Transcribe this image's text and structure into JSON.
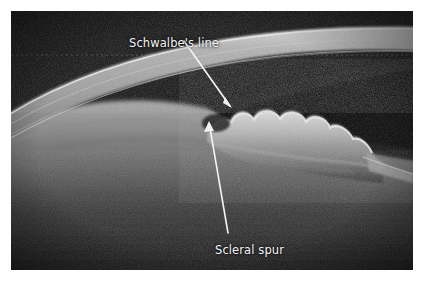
{
  "figure": {
    "kind": "anterior-segment-oct-image",
    "modality_caption": "Anterior segment OCT of the iridocorneal angle",
    "frame": {
      "x": 11,
      "y": 11,
      "width": 402,
      "height": 259
    },
    "background_color": "#ffffff",
    "image_background_color": "#070707"
  },
  "annotations": {
    "schwalbe": {
      "label": "Schwalbe's line",
      "text_x": 118,
      "text_y": 27,
      "leader": {
        "x1": 184,
        "y1": 41,
        "x2": 231,
        "y2": 107
      },
      "arrow_tip": {
        "x": 232,
        "y": 108
      },
      "color": "#f4f4f4"
    },
    "scleral_spur": {
      "label": "Scleral spur",
      "text_x": 204,
      "text_y": 234,
      "leader": {
        "x1": 228,
        "y1": 231,
        "x2": 210,
        "y2": 125
      },
      "arrow_tip": {
        "x": 209,
        "y": 121
      },
      "color": "#f4f4f4"
    }
  },
  "anatomy": {
    "structures": [
      {
        "name": "cornea",
        "description": "Bright curved corneal band sweeping from lower-left to upper-right",
        "brightness": "#b9b9b9"
      },
      {
        "name": "corneal-epithelium-edge",
        "description": "Bright anterior surface line along the top of the cornea",
        "brightness": "#e8e8e8"
      },
      {
        "name": "anterior-chamber",
        "description": "Dark signal-free space beneath the cornea and above the iris",
        "brightness": "#0b0b0b"
      },
      {
        "name": "iris",
        "description": "Scalloped bumpy bright band below the anterior chamber on the right side",
        "brightness": "#c9c9c9"
      },
      {
        "name": "iris-root",
        "description": "Iris tapering to the periphery at the right",
        "brightness": "#9a9a9a"
      },
      {
        "name": "sclera",
        "description": "Broad grey tissue region in the lower-left",
        "brightness": "#4a4a4a"
      },
      {
        "name": "lens-capsule",
        "description": "Faint grey arc crossing the lower-left region",
        "brightness": "#565656"
      },
      {
        "name": "iridocorneal-angle",
        "description": "Junction of cornea and iris where both annotations point",
        "brightness": "#141414"
      }
    ],
    "iris_lobe_count": 6
  },
  "colors": {
    "label_text": "#f4f4f4",
    "leader_line": "#f2f2f2",
    "page_background": "#ffffff",
    "oct_background": "#070707",
    "cornea_bright": "#cfcfcf",
    "iris_bright": "#d2d2d2"
  }
}
